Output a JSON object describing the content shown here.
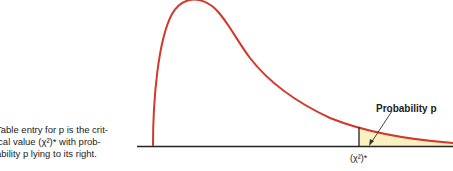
{
  "caption": {
    "line1": "Table entry for p is the crit-",
    "line2": "ical value (χ²)* with prob-",
    "line3": "ability p lying to its right."
  },
  "diagram": {
    "type": "chi-square density curve",
    "shaded_label": "Probability p",
    "critical_label": "(χ²)*",
    "colors": {
      "curve": "#d0392b",
      "shade": "#fbf0c0",
      "axis": "#222222"
    }
  }
}
